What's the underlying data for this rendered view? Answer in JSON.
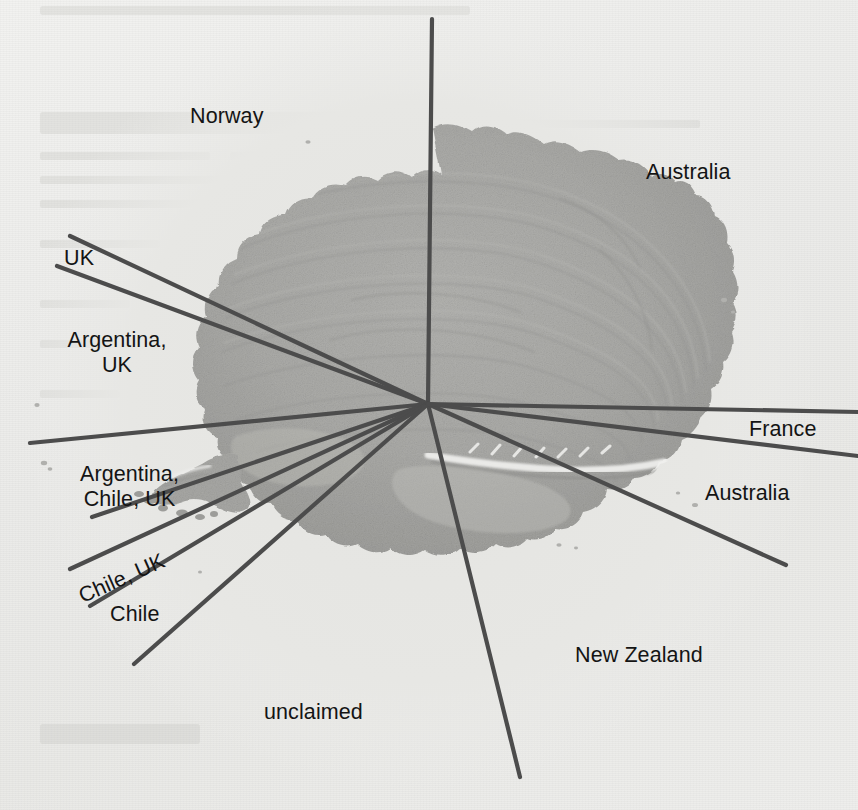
{
  "document": {
    "type": "map-figure",
    "subject": "Antarctic territorial claims",
    "background_color": "#ebebe9",
    "landmass_color": "#a9a9a7",
    "line_color": "#4a4a4a",
    "text_color": "#141414"
  },
  "map": {
    "pole_marker": {
      "x": 428,
      "y": 404,
      "label": "South Pole convergence point"
    },
    "labels": [
      {
        "id": "norway",
        "text": "Norway",
        "x": 190,
        "y": 104,
        "align": "left",
        "rotate": 0
      },
      {
        "id": "australia-top",
        "text": "Australia",
        "x": 646,
        "y": 160,
        "align": "left",
        "rotate": 0
      },
      {
        "id": "uk",
        "text": "UK",
        "x": 64,
        "y": 246,
        "align": "left",
        "rotate": 0
      },
      {
        "id": "argentina-uk",
        "text": "Argentina,\nUK",
        "x": 52,
        "y": 328,
        "align": "center",
        "rotate": 0
      },
      {
        "id": "france",
        "text": "France",
        "x": 749,
        "y": 417,
        "align": "left",
        "rotate": 0
      },
      {
        "id": "argentina-chile-uk",
        "text": "Argentina,\nChile, UK",
        "x": 57,
        "y": 462,
        "align": "center",
        "rotate": 0
      },
      {
        "id": "australia-right",
        "text": "Australia",
        "x": 705,
        "y": 481,
        "align": "left",
        "rotate": 0
      },
      {
        "id": "chile-uk",
        "text": "Chile, UK",
        "x": 75,
        "y": 586,
        "align": "left",
        "rotate": -24
      },
      {
        "id": "chile",
        "text": "Chile",
        "x": 110,
        "y": 602,
        "align": "left",
        "rotate": 0
      },
      {
        "id": "new-zealand",
        "text": "New Zealand",
        "x": 575,
        "y": 643,
        "align": "left",
        "rotate": 0
      },
      {
        "id": "unclaimed",
        "text": "unclaimed",
        "x": 264,
        "y": 700,
        "align": "left",
        "rotate": 0
      }
    ],
    "claim_sectors": [
      "Norway",
      "Australia",
      "UK",
      "Argentina, UK",
      "France",
      "Argentina, Chile, UK",
      "Australia",
      "Chile, UK",
      "Chile",
      "New Zealand",
      "unclaimed"
    ],
    "boundary_lines": [
      {
        "id": "meridian-0",
        "x1": 432,
        "y1": 19,
        "x2": 428,
        "y2": 404,
        "name": "norway-australia-boundary"
      },
      {
        "id": "meridian-uk-n",
        "x1": 70,
        "y1": 236,
        "x2": 428,
        "y2": 404,
        "name": "norway-uk-boundary"
      },
      {
        "id": "meridian-uk-s",
        "x1": 57,
        "y1": 266,
        "x2": 428,
        "y2": 404,
        "name": "uk-argentinauk-boundary"
      },
      {
        "id": "meridian-arg",
        "x1": 30,
        "y1": 443,
        "x2": 428,
        "y2": 404,
        "name": "argentinauk-argentinachileuk-boundary"
      },
      {
        "id": "meridian-ach",
        "x1": 92,
        "y1": 517,
        "x2": 428,
        "y2": 404,
        "name": "argentinachileuk-chileuk-boundary"
      },
      {
        "id": "meridian-chu",
        "x1": 70,
        "y1": 569,
        "x2": 428,
        "y2": 404,
        "name": "chileuk-upper-boundary"
      },
      {
        "id": "meridian-chl",
        "x1": 90,
        "y1": 606,
        "x2": 428,
        "y2": 404,
        "name": "chileuk-chile-boundary"
      },
      {
        "id": "meridian-unc",
        "x1": 134,
        "y1": 664,
        "x2": 428,
        "y2": 404,
        "name": "chile-unclaimed-boundary"
      },
      {
        "id": "meridian-nz",
        "x1": 520,
        "y1": 777,
        "x2": 428,
        "y2": 404,
        "name": "unclaimed-newzealand-boundary"
      },
      {
        "id": "meridian-aus",
        "x1": 786,
        "y1": 565,
        "x2": 428,
        "y2": 404,
        "name": "newzealand-australia-boundary"
      },
      {
        "id": "meridian-fr-s",
        "x1": 858,
        "y1": 456,
        "x2": 428,
        "y2": 404,
        "name": "australia-france-boundary"
      },
      {
        "id": "meridian-fr-n",
        "x1": 858,
        "y1": 412,
        "x2": 428,
        "y2": 404,
        "name": "france-australia-boundary"
      }
    ]
  }
}
